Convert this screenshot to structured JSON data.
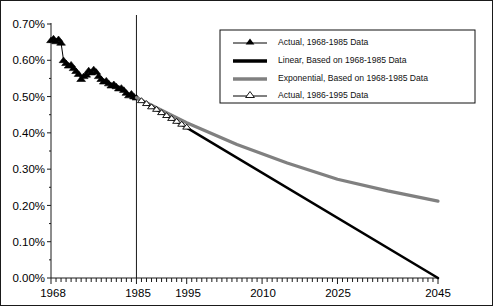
{
  "chart_data": {
    "type": "line",
    "title": "",
    "xlabel": "",
    "ylabel": "",
    "xlim": [
      1968,
      2045
    ],
    "ylim": [
      0.0,
      0.7
    ],
    "grid": false,
    "legend_position": "upper-right",
    "y_tick_labels": [
      "0.70%",
      "0.60%",
      "0.50%",
      "0.40%",
      "0.30%",
      "0.20%",
      "0.10%",
      "0.00%"
    ],
    "y_tick_values": [
      0.7,
      0.6,
      0.5,
      0.4,
      0.3,
      0.2,
      0.1,
      0.0
    ],
    "x_tick_labels": [
      "1968",
      "1985",
      "1995",
      "2010",
      "2025",
      "2045"
    ],
    "x_tick_values": [
      1968,
      1985,
      1995,
      2010,
      2025,
      2045
    ],
    "minor_tick_interval": 1,
    "reference_line": {
      "label": "1985",
      "x": 1985
    },
    "colors": {
      "actual_marker": "#000000",
      "linear": "#000000",
      "exponential": "#808080",
      "axis": "#1a1a1a",
      "background": "#ffffff"
    },
    "series": [
      {
        "name": "Actual, 1968-1985 Data",
        "marker": "filled-triangle",
        "color": "#000000",
        "x": [
          1968,
          1968.5,
          1969,
          1969.5,
          1970,
          1970.5,
          1971,
          1971.5,
          1972,
          1972.5,
          1973,
          1973.5,
          1974,
          1974.5,
          1975,
          1975.5,
          1976,
          1976.5,
          1977,
          1977.5,
          1978,
          1978.5,
          1979,
          1979.5,
          1980,
          1980.5,
          1981,
          1981.5,
          1982,
          1982.5,
          1983,
          1983.5,
          1984,
          1984.5,
          1985
        ],
        "values": [
          0.655,
          0.66,
          0.652,
          0.658,
          0.648,
          0.6,
          0.592,
          0.585,
          0.588,
          0.578,
          0.57,
          0.562,
          0.548,
          0.556,
          0.56,
          0.572,
          0.566,
          0.575,
          0.568,
          0.556,
          0.548,
          0.541,
          0.544,
          0.536,
          0.53,
          0.534,
          0.528,
          0.522,
          0.524,
          0.518,
          0.51,
          0.503,
          0.508,
          0.5,
          0.497
        ]
      },
      {
        "name": "Linear, Based on 1968-1985 Data",
        "marker": "none",
        "color": "#000000",
        "x": [
          1985,
          2045
        ],
        "values": [
          0.497,
          0.0
        ]
      },
      {
        "name": "Exponential, Based on 1968-1985 Data",
        "marker": "none",
        "color": "#808080",
        "x": [
          1985,
          1995,
          2005,
          2015,
          2025,
          2035,
          2045
        ],
        "values": [
          0.497,
          0.428,
          0.368,
          0.317,
          0.272,
          0.24,
          0.212
        ]
      },
      {
        "name": "Actual, 1986-1995 Data",
        "marker": "open-triangle",
        "color": "#000000",
        "x": [
          1986,
          1987,
          1988,
          1989,
          1990,
          1991,
          1992,
          1993,
          1994,
          1995
        ],
        "values": [
          0.489,
          0.481,
          0.472,
          0.465,
          0.456,
          0.448,
          0.44,
          0.432,
          0.424,
          0.416
        ]
      }
    ]
  },
  "legend": {
    "items": [
      {
        "label": "Actual, 1968-1985 Data",
        "marker": "filled-triangle",
        "color": "#000000"
      },
      {
        "label": "Linear, Based on 1968-1985 Data",
        "marker": "thick-line",
        "color": "#000000"
      },
      {
        "label": "Exponential, Based on 1968-1985 Data",
        "marker": "thick-line",
        "color": "#808080"
      },
      {
        "label": "Actual, 1986-1995 Data",
        "marker": "open-triangle",
        "color": "#000000"
      }
    ]
  }
}
